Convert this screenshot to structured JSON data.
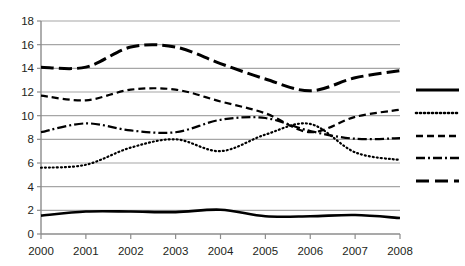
{
  "chart_data": {
    "type": "line",
    "title": "",
    "subtitle": "",
    "xlabel": "",
    "ylabel": "",
    "x": [
      2000,
      2001,
      2002,
      2003,
      2004,
      2005,
      2006,
      2007,
      2008
    ],
    "categories": [
      "2000",
      "2001",
      "2002",
      "2003",
      "2004",
      "2005",
      "2006",
      "2007",
      "2008"
    ],
    "xlim": [
      2000,
      2008
    ],
    "ylim": [
      0,
      18
    ],
    "y_ticks": [
      0,
      2,
      4,
      6,
      8,
      10,
      12,
      14,
      16,
      18
    ],
    "x_ticks": [
      "2000",
      "2001",
      "2002",
      "2003",
      "2004",
      "2005",
      "2006",
      "2007",
      "2008"
    ],
    "grid": true,
    "grid_axis": "y",
    "grid_color": "#a6a6a6",
    "legend_position": "right",
    "line_color": "#000000",
    "series": [
      {
        "name": "series-1",
        "style": "solid",
        "dash": "none",
        "width": 2.6,
        "values": [
          1.55,
          1.9,
          1.9,
          1.85,
          2.05,
          1.5,
          1.5,
          1.6,
          1.35
        ]
      },
      {
        "name": "series-2",
        "style": "dotted",
        "dash": "1,3",
        "width": 2.2,
        "values": [
          5.6,
          5.85,
          7.3,
          8.0,
          7.0,
          8.4,
          9.3,
          6.9,
          6.25
        ]
      },
      {
        "name": "series-3",
        "style": "dashed",
        "dash": "7,4",
        "width": 2.2,
        "values": [
          11.7,
          11.3,
          12.2,
          12.2,
          11.2,
          10.2,
          8.6,
          9.9,
          10.5
        ]
      },
      {
        "name": "series-4",
        "style": "dash-dot",
        "dash": "9,3,2,3",
        "width": 2.2,
        "values": [
          8.6,
          9.35,
          8.75,
          8.6,
          9.65,
          9.8,
          8.7,
          8.05,
          8.1
        ]
      },
      {
        "name": "series-5",
        "style": "long-dash",
        "dash": "13,5",
        "width": 3.0,
        "values": [
          14.1,
          14.1,
          15.8,
          15.8,
          14.4,
          13.1,
          12.1,
          13.2,
          13.8
        ]
      }
    ],
    "legend_items": [
      {
        "label": "",
        "style": "solid",
        "dash": "none",
        "width": 3.2
      },
      {
        "label": "",
        "style": "dotted",
        "dash": "1,3",
        "width": 2.6
      },
      {
        "label": "",
        "style": "dashed",
        "dash": "7,4",
        "width": 2.6
      },
      {
        "label": "",
        "style": "dash-dot",
        "dash": "9,3,2,3",
        "width": 2.6
      },
      {
        "label": "",
        "style": "long-dash",
        "dash": "13,6",
        "width": 3.2
      }
    ]
  },
  "page": {
    "clipped_title_fragment": ""
  }
}
